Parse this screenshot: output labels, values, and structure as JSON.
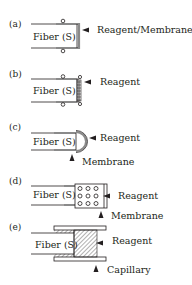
{
  "figure": {
    "panels": [
      {
        "id": "a",
        "letter": "(a)",
        "fiber_label": "Fiber (S)",
        "annotations": [
          "Reagent/Membrane"
        ]
      },
      {
        "id": "b",
        "letter": "(b)",
        "fiber_label": "Fiber (S)",
        "annotations": [
          "Reagent"
        ]
      },
      {
        "id": "c",
        "letter": "(c)",
        "fiber_label": "Fiber (S)",
        "annotations": [
          "Reagent",
          "Membrane"
        ]
      },
      {
        "id": "d",
        "letter": "(d)",
        "fiber_label": "Fiber (S)",
        "annotations": [
          "Reagent",
          "Membrane"
        ]
      },
      {
        "id": "e",
        "letter": "(e)",
        "fiber_label": "Fiber (S)",
        "annotations": [
          "Reagent",
          "Capillary"
        ]
      }
    ]
  },
  "colors": {
    "ink": "#231f20",
    "sleeve": "#8a8a8a"
  }
}
